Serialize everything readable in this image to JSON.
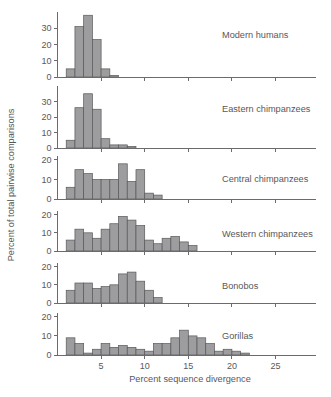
{
  "chart_data": {
    "type": "bar",
    "title": "",
    "xlabel": "Percent sequence divergence",
    "ylabel": "Percent of total pairwise comparisons",
    "xlim": [
      0,
      26
    ],
    "xticks": [
      5,
      10,
      15,
      20,
      25
    ],
    "xtick_labels": [
      "5",
      "10",
      "15",
      "20",
      "25"
    ],
    "grid": false,
    "legend": "none",
    "bin_width": 1,
    "panels": [
      {
        "label": "Modern humans",
        "ylim": [
          0,
          40
        ],
        "yticks": [
          0,
          10,
          20,
          30
        ],
        "ytick_labels": [
          "0",
          "10",
          "20",
          "30"
        ],
        "bin_starts": [
          1,
          2,
          3,
          4,
          5,
          6
        ],
        "values": [
          5,
          31,
          38,
          23,
          5,
          1
        ]
      },
      {
        "label": "Eastern chimpanzees",
        "ylim": [
          0,
          40
        ],
        "yticks": [
          0,
          10,
          20,
          30
        ],
        "ytick_labels": [
          "0",
          "10",
          "20",
          "30"
        ],
        "bin_starts": [
          1,
          2,
          3,
          4,
          5,
          6,
          7,
          8
        ],
        "values": [
          5,
          26,
          35,
          25,
          6,
          2,
          2,
          1
        ]
      },
      {
        "label": "Central chimpanzees",
        "ylim": [
          0,
          22
        ],
        "yticks": [
          0,
          10,
          20
        ],
        "ytick_labels": [
          "0",
          "10",
          "20"
        ],
        "bin_starts": [
          1,
          2,
          3,
          4,
          5,
          6,
          7,
          8,
          9,
          10,
          11
        ],
        "values": [
          6,
          15,
          13,
          10,
          10,
          10,
          18,
          9,
          15,
          3,
          2
        ]
      },
      {
        "label": "Western chimpanzees",
        "ylim": [
          0,
          22
        ],
        "yticks": [
          0,
          10,
          20
        ],
        "ytick_labels": [
          "0",
          "10",
          "20"
        ],
        "bin_starts": [
          1,
          2,
          3,
          4,
          5,
          6,
          7,
          8,
          9,
          10,
          11,
          12,
          13,
          14,
          15
        ],
        "values": [
          6,
          12,
          10,
          7,
          12,
          15,
          19,
          17,
          14,
          6,
          4,
          7,
          8,
          5,
          3
        ]
      },
      {
        "label": "Bonobos",
        "ylim": [
          0,
          22
        ],
        "yticks": [
          0,
          10,
          20
        ],
        "ytick_labels": [
          "0",
          "10",
          "20"
        ],
        "bin_starts": [
          1,
          2,
          3,
          4,
          5,
          6,
          7,
          8,
          9,
          10,
          11
        ],
        "values": [
          7,
          11,
          11,
          8,
          9,
          10,
          16,
          17,
          12,
          7,
          3
        ]
      },
      {
        "label": "Gorillas",
        "ylim": [
          0,
          22
        ],
        "yticks": [
          0,
          10,
          20
        ],
        "ytick_labels": [
          "0",
          "10",
          "20"
        ],
        "bin_starts": [
          1,
          2,
          3,
          4,
          5,
          6,
          7,
          8,
          9,
          10,
          11,
          12,
          13,
          14,
          15,
          16,
          17,
          18,
          19,
          20,
          21
        ],
        "values": [
          9,
          6,
          1,
          3,
          6,
          4,
          5,
          4,
          3,
          2,
          6,
          6,
          9,
          13,
          10,
          9,
          6,
          2,
          3,
          2,
          1
        ]
      }
    ]
  }
}
